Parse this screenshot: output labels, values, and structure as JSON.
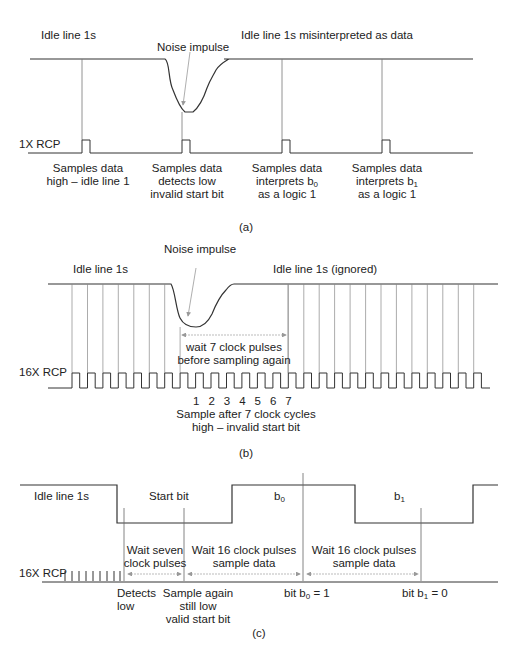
{
  "figure": {
    "panel_a": {
      "caption": "(a)",
      "label_idle_left": "Idle line 1s",
      "label_idle_right": "Idle line 1s misinterpreted as data",
      "label_noise": "Noise impulse",
      "label_clock": "1X RCP",
      "samples": [
        {
          "line1": "Samples data",
          "line2": "high – idle line 1",
          "line3": ""
        },
        {
          "line1": "Samples data",
          "line2": "detects low",
          "line3": "invalid start bit"
        },
        {
          "line1": "Samples data",
          "line2": "interprets b",
          "line2_sub": "0",
          "line3": "as a logic 1"
        },
        {
          "line1": "Samples data",
          "line2": "interprets b",
          "line2_sub": "1",
          "line3": "as a logic 1"
        }
      ]
    },
    "panel_b": {
      "caption": "(b)",
      "label_idle_left": "Idle line 1s",
      "label_idle_right": "Idle line 1s (ignored)",
      "label_noise": "Noise impulse",
      "label_wait_1": "wait 7 clock pulses",
      "label_wait_2": "before sampling again",
      "label_clock": "16X RCP",
      "counts": [
        "1",
        "2",
        "3",
        "4",
        "5",
        "6",
        "7"
      ],
      "label_sample_1": "Sample after 7 clock cycles",
      "label_sample_2": "high – invalid start bit"
    },
    "panel_c": {
      "caption": "(c)",
      "label_idle": "Idle line 1s",
      "label_start": "Start bit",
      "label_b0": "b",
      "label_b0_sub": "0",
      "label_b1": "b",
      "label_b1_sub": "1",
      "label_clock": "16X RCP",
      "wait_seven_1": "Wait seven",
      "wait_seven_2": "clock pulses",
      "wait16a_1": "Wait 16 clock pulses",
      "wait16a_2": "sample data",
      "wait16b_1": "Wait 16 clock pulses",
      "wait16b_2": "sample data",
      "detects_1": "Detects",
      "detects_2": "low",
      "sample_again_1": "Sample again",
      "sample_again_2": "still low",
      "sample_again_3": "valid start bit",
      "bit0_pre": "bit b",
      "bit0_sub": "0",
      "bit0_post": " = 1",
      "bit1_pre": "bit b",
      "bit1_sub": "1",
      "bit1_post": " = 0"
    }
  }
}
